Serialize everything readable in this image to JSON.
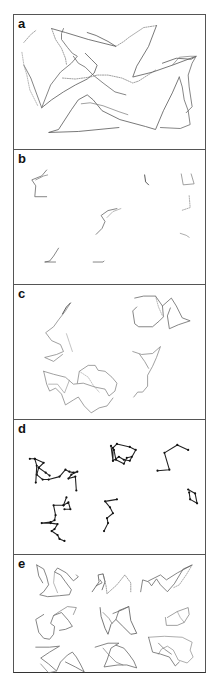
{
  "figure": {
    "panels": [
      {
        "id": "a",
        "label": "a",
        "top": 0,
        "height": 134,
        "paths": [
          {
            "pts": "10,50 17,63 28,93 37,70 47,57 58,48 64,41 59,38 54,32 48,24 48,18 50,13",
            "dash": false,
            "stroke": "#666",
            "w": 0.8
          },
          {
            "pts": "38,13 52,17 75,24 103,31 95,26 83,20 74,17",
            "dash": false,
            "stroke": "#555",
            "w": 0.8
          },
          {
            "pts": "10,27 17,19 22,15",
            "dash": true,
            "stroke": "#777",
            "w": 0.7
          },
          {
            "pts": "38,13 42,24 48,33 52,43 53,49",
            "dash": true,
            "stroke": "#777",
            "w": 0.7
          },
          {
            "pts": "8,37 10,50 13,60 16,75 24,91",
            "dash": true,
            "stroke": "#999",
            "w": 0.7
          },
          {
            "pts": "49,63 62,64 77,62 84,60 95,60 109,63 120,68 126,66 143,55",
            "dash": true,
            "stroke": "#777",
            "w": 0.7
          },
          {
            "pts": "103,31 111,26 116,22 131,12 144,10",
            "dash": true,
            "stroke": "#777",
            "w": 0.7
          },
          {
            "pts": "144,10 136,31 124,51 120,62 140,57 160,50 184,41 179,44 164,43 150,48",
            "dash": false,
            "stroke": "#555",
            "w": 0.8
          },
          {
            "pts": "184,41 180,48 176,60 177,72 180,92 174,98",
            "dash": false,
            "stroke": "#666",
            "w": 0.8
          },
          {
            "pts": "160,50 167,42 178,41 184,41",
            "dash": false,
            "stroke": "#777",
            "w": 0.7
          },
          {
            "pts": "167,62 160,78 151,96 143,115 133,112 107,105 89,96 80,85 74,80 65,85 58,95 45,115 35,118 65,117 106,113",
            "dash": false,
            "stroke": "#555",
            "w": 0.8
          },
          {
            "pts": "167,62 170,72 172,85 176,96 178,110 168,114 148,113",
            "dash": false,
            "stroke": "#666",
            "w": 0.8
          },
          {
            "pts": "28,93 38,85 50,77 62,70 74,64 81,58 84,50 78,44 72,38",
            "dash": false,
            "stroke": "#555",
            "w": 0.8
          },
          {
            "pts": "60,41 65,48 72,52 80,60 90,68 102,77 113,80",
            "dash": false,
            "stroke": "#666",
            "w": 0.8
          },
          {
            "pts": "68,89 77,88 90,91 106,97 115,100",
            "dash": false,
            "stroke": "#777",
            "w": 0.7
          }
        ]
      },
      {
        "id": "b",
        "label": "b",
        "top": 134,
        "height": 135,
        "paths": [
          {
            "pts": "33,20 28,26 18,30 22,36 21,47 33,47",
            "dash": false,
            "stroke": "#666",
            "w": 0.8
          },
          {
            "pts": "22,30 30,26 34,25",
            "dash": false,
            "stroke": "#777",
            "w": 0.7
          },
          {
            "pts": "132,25 133,32 136,35",
            "dash": false,
            "stroke": "#444",
            "w": 0.9
          },
          {
            "pts": "169,24 171,35 182,34 179,24",
            "dash": false,
            "stroke": "#777",
            "w": 0.7
          },
          {
            "pts": "177,46 178,58 169,61",
            "dash": true,
            "stroke": "#888",
            "w": 0.7
          },
          {
            "pts": "104,59 95,61 88,66 92,72 89,79 83,85",
            "dash": false,
            "stroke": "#666",
            "w": 0.8
          },
          {
            "pts": "94,68 100,62 108,59",
            "dash": false,
            "stroke": "#888",
            "w": 0.6
          },
          {
            "pts": "168,84 174,86 177,88",
            "dash": false,
            "stroke": "#888",
            "w": 0.7
          },
          {
            "pts": "45,99 40,107 36,112 31,113 42,113",
            "dash": false,
            "stroke": "#666",
            "w": 0.8
          },
          {
            "pts": "80,113 90,113 91,112",
            "dash": false,
            "stroke": "#666",
            "w": 0.8
          }
        ]
      },
      {
        "id": "c",
        "label": "c",
        "top": 269,
        "height": 135,
        "paths": [
          {
            "pts": "57,18 52,26 45,35 40,42 32,48 38,56 47,60 50,67 43,70 31,73 40,77 49,70",
            "dash": false,
            "stroke": "#777",
            "w": 0.7
          },
          {
            "pts": "57,18 53,22 49,29",
            "dash": false,
            "stroke": "#444",
            "w": 0.9
          },
          {
            "pts": "53,49 56,58 59,67",
            "dash": false,
            "stroke": "#999",
            "w": 0.6
          },
          {
            "pts": "122,13 131,11 143,11 150,21 151,32 147,36 140,42 126,42 122,39 120,26 124,22",
            "dash": false,
            "stroke": "#666",
            "w": 0.8
          },
          {
            "pts": "150,21 159,13 164,21 170,33 178,36 166,40 157,44 155,31 158,23",
            "dash": false,
            "stroke": "#666",
            "w": 0.8
          },
          {
            "pts": "143,11 146,22 150,31",
            "dash": true,
            "stroke": "#888",
            "w": 0.6
          },
          {
            "pts": "120,67 129,70 140,69 148,62 144,73 140,82 135,91 135,102 130,108 125,108 121,113",
            "dash": false,
            "stroke": "#777",
            "w": 0.7
          },
          {
            "pts": "127,70 132,77 136,84",
            "dash": false,
            "stroke": "#777",
            "w": 0.7
          },
          {
            "pts": "30,87 40,90 52,93 60,100 70,99 82,103 92,105 96,112 102,107 104,99 99,93 92,87 85,86 82,81 75,81 66,87 64,99",
            "dash": false,
            "stroke": "#777",
            "w": 0.7
          },
          {
            "pts": "30,87 33,100 36,107 42,104 48,110 52,121 60,116 65,113 71,122 78,129 86,124 94,122 100,114",
            "dash": false,
            "stroke": "#777",
            "w": 0.7
          },
          {
            "pts": "35,100 44,100 51,109 56,96",
            "dash": false,
            "stroke": "#888",
            "w": 0.6
          },
          {
            "pts": "66,87 75,93 80,101 86,108",
            "dash": true,
            "stroke": "#999",
            "w": 0.6
          }
        ]
      },
      {
        "id": "d",
        "label": "d",
        "top": 404,
        "height": 135,
        "paths": [
          {
            "pts": "16,39 21,39 30,43 25,48 23,55 29,60 35,60 46,57 52,50 56,52 60,53 64,52 58,55 55,59 62,57 63,71",
            "dash": false,
            "stroke": "#222",
            "w": 1.1,
            "dots": true
          },
          {
            "pts": "21,39 23,46 22,63",
            "dash": false,
            "stroke": "#222",
            "w": 1.1,
            "dots": true
          },
          {
            "pts": "25,48 32,53 36,56",
            "dash": false,
            "stroke": "#222",
            "w": 1.1,
            "dots": true
          },
          {
            "pts": "53,78 50,86 40,86 42,96 41,101 37,103 28,104 37,104 44,105 41,110 38,112 44,116 46,120 51,122",
            "dash": false,
            "stroke": "#222",
            "w": 1.1,
            "dots": true
          },
          {
            "pts": "50,86 55,83 57,90 51,90",
            "dash": false,
            "stroke": "#222",
            "w": 1.1,
            "dots": true
          },
          {
            "pts": "98,26 100,41 106,37 111,40 117,41 123,30 117,27 104,24 100,28 100,41",
            "dash": false,
            "stroke": "#222",
            "w": 1.1,
            "dots": true
          },
          {
            "pts": "101,30 103,40 111,44 114,38 119,37",
            "dash": false,
            "stroke": "#222",
            "w": 1.1,
            "dots": true
          },
          {
            "pts": "145,51 157,50 152,33 165,25 176,30",
            "dash": false,
            "stroke": "#222",
            "w": 1.1,
            "dots": true
          },
          {
            "pts": "91,112 95,104 94,99 100,94 97,88 92,82 104,80",
            "dash": false,
            "stroke": "#222",
            "w": 1.1,
            "dots": true
          },
          {
            "pts": "176,70 183,74 185,84 178,80 177,73",
            "dash": false,
            "stroke": "#222",
            "w": 1.1,
            "dots": true
          }
        ]
      },
      {
        "id": "e",
        "label": "e",
        "top": 539,
        "height": 120,
        "paths": [
          {
            "pts": "23,10 30,14 33,22 35,30 30,37 26,40 34,42 46,41 56,40 58,35 52,27 47,20 41,17 44,13 53,18 60,26 65,22 63,20",
            "dash": false,
            "stroke": "#666",
            "w": 0.8
          },
          {
            "pts": "23,10 25,21 29,28",
            "dash": false,
            "stroke": "#666",
            "w": 0.8
          },
          {
            "pts": "41,17 40,28 44,38",
            "dash": false,
            "stroke": "#888",
            "w": 0.6
          },
          {
            "pts": "79,37 86,27 85,20 90,19 92,27 89,35",
            "dash": false,
            "stroke": "#555",
            "w": 0.8
          },
          {
            "pts": "90,19 93,31 94,39 104,30 112,20 118,28 118,37",
            "dash": true,
            "stroke": "#777",
            "w": 0.7
          },
          {
            "pts": "83,31 89,28 87,25",
            "dash": false,
            "stroke": "#666",
            "w": 0.8
          },
          {
            "pts": "128,37 130,25 136,27 139,31 144,24 148,30 155,37 162,29 171,14 180,10 165,18 154,25 148,20 136,26",
            "dash": false,
            "stroke": "#666",
            "w": 0.8
          },
          {
            "pts": "180,10 174,20 167,30 161,33",
            "dash": true,
            "stroke": "#888",
            "w": 0.7
          },
          {
            "pts": "30,60 22,65 25,78 30,84 36,85 40,80 41,72 37,69 40,61 48,58 55,66 59,72 52,75 46,76",
            "dash": false,
            "stroke": "#666",
            "w": 0.8
          },
          {
            "pts": "40,61 46,57 54,52 63,53 60,60",
            "dash": false,
            "stroke": "#777",
            "w": 0.7
          },
          {
            "pts": "87,53 88,62 92,74 95,80 98,70 103,65 110,72 118,80 124,79 118,66 116,52",
            "dash": false,
            "stroke": "#555",
            "w": 0.8
          },
          {
            "pts": "100,59 110,55 116,52 106,56 103,65",
            "dash": false,
            "stroke": "#666",
            "w": 0.8
          },
          {
            "pts": "90,58 96,64 99,69",
            "dash": false,
            "stroke": "#777",
            "w": 0.7
          },
          {
            "pts": "155,63 165,57 176,53 177,60 172,68 165,71 154,71 153,63",
            "dash": false,
            "stroke": "#777",
            "w": 0.7
          },
          {
            "pts": "165,57 168,63 172,68",
            "dash": false,
            "stroke": "#888",
            "w": 0.6
          },
          {
            "pts": "22,93 36,93 46,92 36,98 27,104 35,110 43,117 47,108 54,101 59,98 63,103 67,110 71,118 62,113 52,108",
            "dash": false,
            "stroke": "#666",
            "w": 0.8
          },
          {
            "pts": "43,117 35,119 27,110",
            "dash": false,
            "stroke": "#777",
            "w": 0.7
          },
          {
            "pts": "82,93 95,89 106,89 98,94 94,106 91,113 98,112 105,111 114,111 124,114 121,107 116,100 111,94 103,91",
            "dash": false,
            "stroke": "#666",
            "w": 0.8
          },
          {
            "pts": "90,94 96,101 103,108 110,111",
            "dash": false,
            "stroke": "#777",
            "w": 0.7
          },
          {
            "pts": "136,83 152,82 170,83 180,88 178,96 181,103 175,109 166,106 161,96 155,92 149,95 146,100",
            "dash": false,
            "stroke": "#888",
            "w": 0.7
          },
          {
            "pts": "136,83 140,98 148,100 157,103 163,112 167,108",
            "dash": false,
            "stroke": "#666",
            "w": 0.8
          },
          {
            "pts": "146,89 152,95 159,100",
            "dash": false,
            "stroke": "#666",
            "w": 0.7
          }
        ]
      }
    ]
  }
}
